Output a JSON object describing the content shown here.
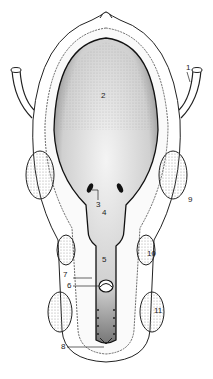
{
  "labels": {
    "l1": "1",
    "l2": "2",
    "l3": "3",
    "l4": "4",
    "l5": "5",
    "l6": "6",
    "l7": "7",
    "l8": "8",
    "l9": "9",
    "l10": "10",
    "l11": "11"
  },
  "colors": {
    "ink": "#222222",
    "stipple": "#9a9a9a",
    "background": "#ffffff"
  }
}
